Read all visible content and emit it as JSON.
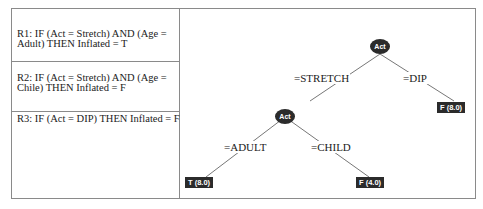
{
  "rules": [
    {
      "id": "R1",
      "text": "R1: IF (Act = Stretch) AND (Age = Adult) THEN Inflated = T"
    },
    {
      "id": "R2",
      "text": "R2: IF (Act = Stretch) AND (Age = Chile) THEN Inflated = F"
    },
    {
      "id": "R3",
      "text": "R3: IF (Act = DIP) THEN Inflated = F"
    }
  ],
  "tree": {
    "root": {
      "label": "Act"
    },
    "child": {
      "label": "Act"
    },
    "edges": {
      "stretch": "=STRETCH",
      "dip": "=DIP",
      "adult": "=ADULT",
      "child": "=CHILD"
    },
    "leaves": {
      "dip": "F (8.0)",
      "adult": "T (8.0)",
      "child": "F (4.0)"
    }
  },
  "colors": {
    "node": "#2b2b2b",
    "border": "#8a8a8a",
    "line": "#777777"
  }
}
